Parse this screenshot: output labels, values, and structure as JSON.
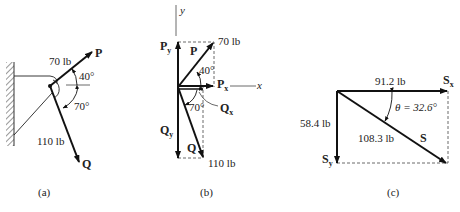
{
  "figure_a": {
    "caption": "(a)",
    "P_label": "P",
    "P_magnitude": "70 lb",
    "P_angle": "40°",
    "Q_label": "Q",
    "Q_magnitude": "110 lb",
    "Q_angle": "70°"
  },
  "figure_b": {
    "caption": "(b)",
    "y_axis": "y",
    "x_axis": "x",
    "Py": "P",
    "Py_sub": "y",
    "P_label": "P",
    "P_magnitude": "70 lb",
    "P_angle": "40°",
    "Px": "P",
    "Px_sub": "x",
    "Qx": "Q",
    "Qx_sub": "x",
    "Q_angle": "70°",
    "Qy": "Q",
    "Qy_sub": "y",
    "Q_label": "Q",
    "Q_magnitude": "110 lb"
  },
  "figure_c": {
    "caption": "(c)",
    "Sx_magnitude": "91.2 lb",
    "Sx": "S",
    "Sx_sub": "x",
    "theta": "θ = 32.6°",
    "Sy_magnitude": "58.4 lb",
    "S_magnitude": "108.3 lb",
    "S_label": "S",
    "Sy": "S",
    "Sy_sub": "y"
  }
}
